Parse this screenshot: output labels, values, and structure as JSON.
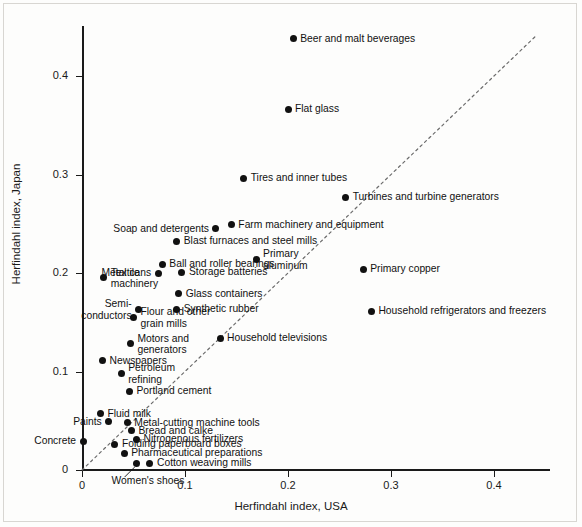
{
  "chart_data": {
    "type": "scatter",
    "title": "",
    "xlabel": "Herfindahl index, USA",
    "ylabel": "Herfindahl index, Japan",
    "xlim": [
      0,
      0.455
    ],
    "ylim": [
      0,
      0.452
    ],
    "xticks": [
      0,
      0.1,
      0.2,
      0.3,
      0.4
    ],
    "yticks": [
      0,
      0.1,
      0.2,
      0.3,
      0.4
    ],
    "xtick_labels": [
      "0",
      "0.1",
      "0.2",
      "0.3",
      "0.4"
    ],
    "ytick_labels": [
      "0",
      "0.1",
      "0.2",
      "0.3",
      "0.4"
    ],
    "grid": false,
    "legend": "none",
    "reference_line": {
      "name": "45-degree-line",
      "style": "dotted",
      "from": [
        0.0,
        0.0
      ],
      "to": [
        0.44,
        0.44
      ]
    },
    "points": [
      {
        "label": "Beer and malt beverages",
        "x": 0.205,
        "y": 0.438,
        "side": "right"
      },
      {
        "label": "Flat glass",
        "x": 0.2,
        "y": 0.366,
        "side": "right"
      },
      {
        "label": "Tires and inner tubes",
        "x": 0.157,
        "y": 0.296,
        "side": "right"
      },
      {
        "label": "Turbines and turbine generators",
        "x": 0.256,
        "y": 0.277,
        "side": "right"
      },
      {
        "label": "Farm machinery and equipment",
        "x": 0.145,
        "y": 0.249,
        "side": "right"
      },
      {
        "label": "Soap and detergents",
        "x": 0.13,
        "y": 0.245,
        "side": "left"
      },
      {
        "label": "Blast furnaces and steel mills",
        "x": 0.092,
        "y": 0.232,
        "side": "right"
      },
      {
        "label": "Primary\naluminum",
        "x": 0.169,
        "y": 0.214,
        "side": "right"
      },
      {
        "label": "Ball and roller bearings",
        "x": 0.078,
        "y": 0.209,
        "side": "right"
      },
      {
        "label": "Primary copper",
        "x": 0.273,
        "y": 0.204,
        "side": "right"
      },
      {
        "label": "Storage batteries",
        "x": 0.097,
        "y": 0.201,
        "side": "right"
      },
      {
        "label": "Metal cans",
        "x": 0.074,
        "y": 0.2,
        "side": "left"
      },
      {
        "label": "Textile\nmachinery",
        "x": 0.021,
        "y": 0.195,
        "side": "right"
      },
      {
        "label": "Glass containers",
        "x": 0.094,
        "y": 0.179,
        "side": "right"
      },
      {
        "label": "Semi-\nconductors",
        "x": 0.055,
        "y": 0.163,
        "side": "left"
      },
      {
        "label": "Synthetic rubber",
        "x": 0.092,
        "y": 0.163,
        "side": "right"
      },
      {
        "label": "Household refrigerators and freezers",
        "x": 0.281,
        "y": 0.161,
        "side": "right"
      },
      {
        "label": "Flour and other\ngrain mills",
        "x": 0.05,
        "y": 0.155,
        "side": "right"
      },
      {
        "label": "Household televisions",
        "x": 0.134,
        "y": 0.134,
        "side": "right"
      },
      {
        "label": "Motors and\ngenerators",
        "x": 0.047,
        "y": 0.128,
        "side": "right"
      },
      {
        "label": "Newspapers",
        "x": 0.02,
        "y": 0.111,
        "side": "right"
      },
      {
        "label": "Petroleum\nrefining",
        "x": 0.038,
        "y": 0.098,
        "side": "right"
      },
      {
        "label": "Portland cement",
        "x": 0.046,
        "y": 0.08,
        "side": "right"
      },
      {
        "label": "Fluid milk",
        "x": 0.018,
        "y": 0.057,
        "side": "right"
      },
      {
        "label": "Metal-cutting machine tools",
        "x": 0.044,
        "y": 0.048,
        "side": "right"
      },
      {
        "label": "Paints",
        "x": 0.026,
        "y": 0.049,
        "side": "left"
      },
      {
        "label": "Bread and calke",
        "x": 0.048,
        "y": 0.04,
        "side": "right"
      },
      {
        "label": "Nitrogenous fertilizers",
        "x": 0.053,
        "y": 0.031,
        "side": "right"
      },
      {
        "label": "Concrete",
        "x": 0.001,
        "y": 0.029,
        "side": "left"
      },
      {
        "label": "Folding paperboard boxes",
        "x": 0.032,
        "y": 0.026,
        "side": "right"
      },
      {
        "label": "Pharmaceutical preparations",
        "x": 0.041,
        "y": 0.017,
        "side": "right"
      },
      {
        "label": "Women's shoes",
        "x": 0.053,
        "y": 0.007,
        "side": "below"
      },
      {
        "label": "Cotton weaving mills",
        "x": 0.066,
        "y": 0.007,
        "side": "right"
      }
    ]
  }
}
